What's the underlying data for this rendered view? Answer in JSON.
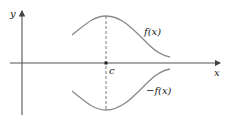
{
  "diagram": {
    "axes": {
      "x_label": "x",
      "y_label": "y"
    },
    "point": {
      "label": "c"
    },
    "curves": [
      {
        "name": "f",
        "label": "f(x)"
      },
      {
        "name": "neg-f",
        "label": "−f(x)"
      }
    ],
    "colors": {
      "axis": "#444444",
      "curve": "#8a8a8a",
      "dashed": "#555555",
      "point": "#222222"
    }
  }
}
